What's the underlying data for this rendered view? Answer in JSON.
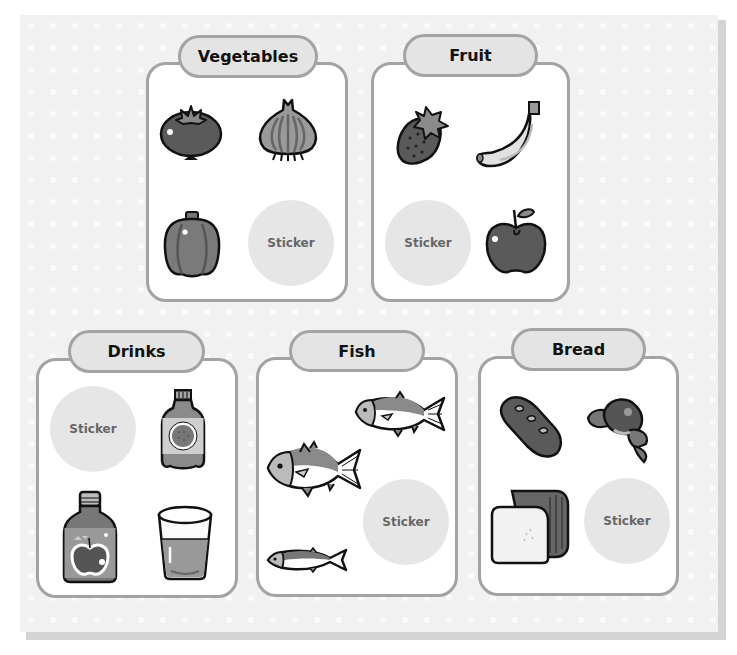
{
  "categories": {
    "vegetables": {
      "title": "Vegetables",
      "items": [
        "tomato",
        "onion",
        "bell-pepper"
      ],
      "sticker_label": "Sticker"
    },
    "fruit": {
      "title": "Fruit",
      "items": [
        "strawberry",
        "banana",
        "apple"
      ],
      "sticker_label": "Sticker"
    },
    "drinks": {
      "title": "Drinks",
      "items": [
        "juice-bottle",
        "apple-juice-bottle",
        "glass-of-juice"
      ],
      "sticker_label": "Sticker"
    },
    "fish": {
      "title": "Fish",
      "items": [
        "fish-large",
        "fish-medium",
        "fish-small"
      ],
      "sticker_label": "Sticker"
    },
    "bread": {
      "title": "Bread",
      "items": [
        "baguette",
        "croissant",
        "loaf-of-bread"
      ],
      "sticker_label": "Sticker"
    }
  },
  "colors": {
    "board": "#f1f1f1",
    "card_border": "#a3a3a3",
    "tab_fill": "#e4e4e4",
    "sticker_fill": "#e6e6e6",
    "sticker_text": "#666666",
    "icon_dark": "#555555",
    "icon_mid": "#8a8a8a",
    "icon_light": "#bdbdbd"
  }
}
